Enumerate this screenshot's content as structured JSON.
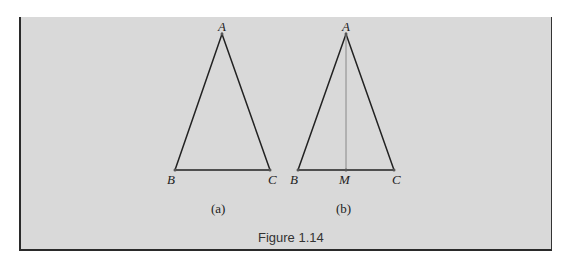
{
  "figure": {
    "caption": "Figure 1.14",
    "panels": [
      {
        "id": "a",
        "label": "(a)",
        "vertices": {
          "A": "A",
          "B": "B",
          "C": "C"
        }
      },
      {
        "id": "b",
        "label": "(b)",
        "vertices": {
          "A": "A",
          "B": "B",
          "M": "M",
          "C": "C"
        },
        "segment": "AM"
      }
    ]
  },
  "colors": {
    "panel_bg": "#d9d9d9",
    "border": "#2a2a2a",
    "lines": "#222222",
    "median": "#888888"
  }
}
